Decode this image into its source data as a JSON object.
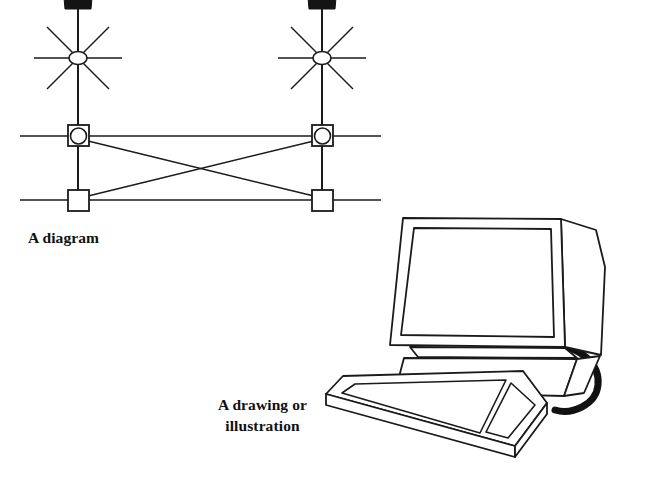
{
  "page": {
    "background_color": "#ffffff",
    "ink_color": "#1a1a1a",
    "width": 656,
    "height": 485
  },
  "figures": [
    {
      "id": "diagram",
      "kind": "technical-line-diagram",
      "caption": "A diagram",
      "description": "Abstract schematic with two vertical masts topped by filled black trapezoid caps, each crossed by an eight-spoke star with a small ellipse hub, connected below by two horizontal rails through square nodes, with diagonal cross-bracing forming an X.",
      "elements": {
        "masts": 2,
        "stars": 2,
        "star_spokes": 8,
        "horizontal_rails": 2,
        "circle_in_square_nodes": 2,
        "plain_square_nodes": 2,
        "diagonal_braces": 2,
        "black_caps": 2
      }
    },
    {
      "id": "illustration",
      "kind": "line-art-drawing",
      "caption_line_1": "A drawing or",
      "caption_line_2": "illustration",
      "caption": "A drawing or\nillustration",
      "description": "Outline drawing of a desktop CRT computer monitor on a tilted pedestal base with a keyboard in front and a thick black cable curving out to the right.",
      "elements": {
        "monitor": "crt-monitor",
        "screen": "blank-screen",
        "base": "pedestal-stand",
        "keyboard": "keyboard-with-keypad",
        "cable": "power-cable"
      }
    }
  ],
  "captions": {
    "diagram": "A diagram",
    "illustration": "A drawing or\nillustration"
  }
}
